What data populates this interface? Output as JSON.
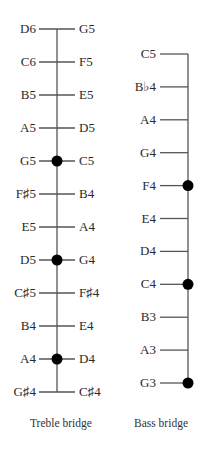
{
  "treble_bridge": {
    "caption": "Treble bridge",
    "rows": [
      {
        "left": "D6",
        "right": "G5",
        "dot": false
      },
      {
        "left": "C6",
        "right": "F5",
        "dot": false
      },
      {
        "left": "B5",
        "right": "E5",
        "dot": false
      },
      {
        "left": "A5",
        "right": "D5",
        "dot": false
      },
      {
        "left": "G5",
        "right": "C5",
        "dot": true
      },
      {
        "left": "F♯5",
        "right": "B4",
        "dot": false
      },
      {
        "left": "E5",
        "right": "A4",
        "dot": false
      },
      {
        "left": "D5",
        "right": "G4",
        "dot": true
      },
      {
        "left": "C♯5",
        "right": "F♯4",
        "dot": false
      },
      {
        "left": "B4",
        "right": "E4",
        "dot": false
      },
      {
        "left": "A4",
        "right": "D4",
        "dot": true
      },
      {
        "left": "G♯4",
        "right": "C♯4",
        "dot": false
      }
    ]
  },
  "bass_bridge": {
    "caption": "Bass bridge",
    "rows": [
      {
        "label": "C5",
        "dot": false
      },
      {
        "label": "B♭4",
        "dot": false
      },
      {
        "label": "A4",
        "dot": false
      },
      {
        "label": "G4",
        "dot": false
      },
      {
        "label": "F4",
        "dot": true
      },
      {
        "label": "E4",
        "dot": false
      },
      {
        "label": "D4",
        "dot": false
      },
      {
        "label": "C4",
        "dot": true
      },
      {
        "label": "B3",
        "dot": false
      },
      {
        "label": "A3",
        "dot": false
      },
      {
        "label": "G3",
        "dot": true
      }
    ]
  },
  "colors": {
    "line": "#555555",
    "dot": "#000000",
    "text": "#2a2a2a"
  }
}
